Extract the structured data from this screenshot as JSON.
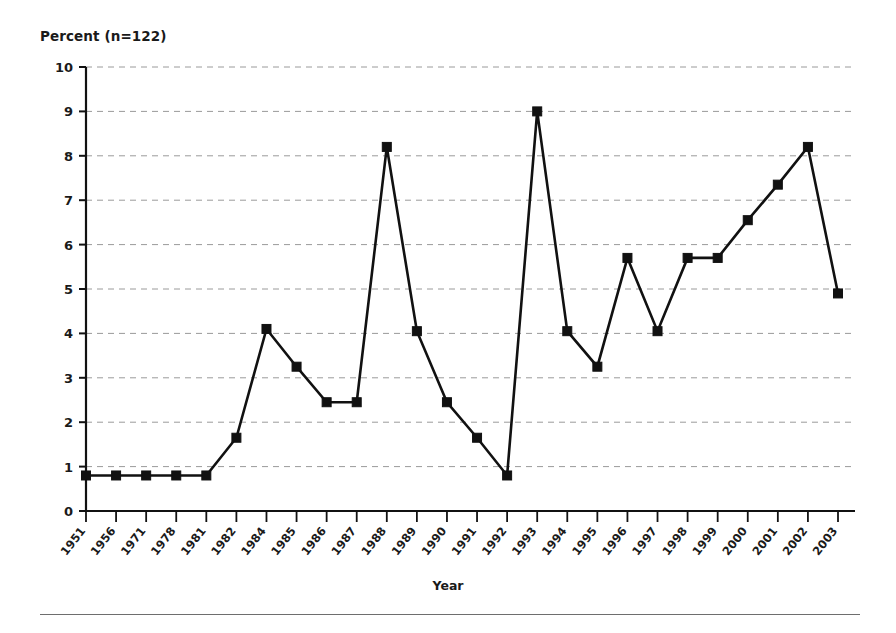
{
  "chart_data": {
    "type": "line",
    "title": "Percent (n=122)",
    "xlabel": "Year",
    "ylabel": "Percent (n=122)",
    "categories": [
      "1951",
      "1956",
      "1971",
      "1978",
      "1981",
      "1982",
      "1984",
      "1985",
      "1986",
      "1987",
      "1988",
      "1989",
      "1990",
      "1991",
      "1992",
      "1993",
      "1994",
      "1995",
      "1996",
      "1997",
      "1998",
      "1999",
      "2000",
      "2001",
      "2002",
      "2003"
    ],
    "values": [
      0.8,
      0.8,
      0.8,
      0.8,
      0.8,
      1.65,
      4.1,
      3.25,
      2.45,
      2.45,
      8.2,
      4.05,
      2.45,
      1.65,
      0.8,
      9.0,
      4.05,
      3.25,
      5.7,
      4.05,
      5.7,
      5.7,
      6.55,
      7.35,
      8.2,
      4.9
    ],
    "ylim": [
      0,
      10
    ],
    "yticks": [
      0,
      1,
      2,
      3,
      4,
      5,
      6,
      7,
      8,
      9,
      10
    ],
    "ytick_labels": [
      "0",
      "1",
      "2",
      "3",
      "4",
      "5",
      "6",
      "7",
      "8",
      "9",
      "10"
    ],
    "grid": true,
    "grid_style": "dashed-horizontal",
    "legend": "none",
    "marker": "square",
    "series_color": "#111111",
    "grid_color": "#9a9a9a",
    "axis_color": "#111111"
  },
  "layout": {
    "plot_left": 86,
    "plot_right": 855,
    "plot_top": 67,
    "plot_bottom": 511,
    "x_spacing": 30.08
  },
  "footer": {
    "rule": ""
  }
}
